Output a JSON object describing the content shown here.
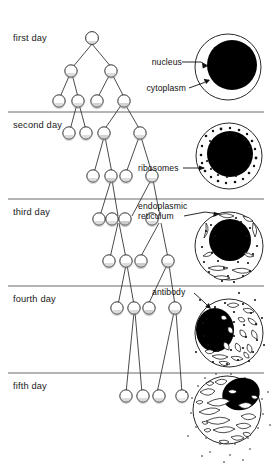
{
  "figure": {
    "type": "biology-diagram",
    "background_color": "#ffffff",
    "ink_color": "#111111",
    "divider_color": "#6b6b6b"
  },
  "rows": [
    {
      "id": "row-first-day",
      "day_label": "first day",
      "lineage_cell_count": 7,
      "terminal_cell_count": 4,
      "cell_diagram": {
        "name": "lymphocyte-day1",
        "features": [
          "nucleus",
          "cytoplasm"
        ],
        "nucleus_fill": "#000000",
        "cytoplasm_fill": "#ffffff",
        "organelle_count": 0,
        "ribosome_count": 0
      }
    },
    {
      "id": "row-second-day",
      "day_label": "second day",
      "lineage_cell_count": 8,
      "terminal_cell_count": 4,
      "cell_diagram": {
        "name": "lymphocyte-day2",
        "features": [
          "nucleus",
          "cytoplasm",
          "ribosomes"
        ],
        "nucleus_fill": "#000000",
        "cytoplasm_fill": "#ffffff",
        "organelle_count": 0,
        "ribosome_count": 34
      }
    },
    {
      "id": "row-third-day",
      "day_label": "third day",
      "lineage_cell_count": 8,
      "terminal_cell_count": 4,
      "cell_diagram": {
        "name": "lymphocyte-day3",
        "features": [
          "nucleus",
          "cytoplasm",
          "ribosomes",
          "endoplasmic reticulum"
        ],
        "nucleus_fill": "#000000",
        "cytoplasm_fill": "#ffffff",
        "organelle_count": 9,
        "ribosome_count": 22
      }
    },
    {
      "id": "row-fourth-day",
      "day_label": "fourth day",
      "lineage_cell_count": 4,
      "terminal_cell_count": 4,
      "cell_diagram": {
        "name": "plasma-cell-day4",
        "features": [
          "nucleus",
          "cytoplasm",
          "ribosomes",
          "endoplasmic reticulum",
          "antibody"
        ],
        "nucleus_fill": "#000000",
        "cytoplasm_fill": "#ffffff",
        "organelle_count": 16,
        "ribosome_count": 30
      }
    },
    {
      "id": "row-fifth-day",
      "day_label": "fifth day",
      "lineage_cell_count": 4,
      "terminal_cell_count": 4,
      "cell_diagram": {
        "name": "plasma-cell-day5",
        "features": [
          "nucleus",
          "cytoplasm",
          "endoplasmic reticulum",
          "antibody secretion"
        ],
        "nucleus_fill": "#000000",
        "cytoplasm_fill": "#ffffff",
        "organelle_count": 18,
        "ribosome_count": 0,
        "secreting": true
      }
    }
  ],
  "callouts": [
    {
      "id": "callout-nucleus",
      "text": "nucleus",
      "row": "row-first-day",
      "points_to": "nucleus"
    },
    {
      "id": "callout-cytoplasm",
      "text": "cytoplasm",
      "row": "row-first-day",
      "points_to": "cytoplasm"
    },
    {
      "id": "callout-ribosomes",
      "text": "ribosomes",
      "row": "row-second-day",
      "points_to": "ribosome"
    },
    {
      "id": "callout-er-line1",
      "text": "endoplasmic",
      "row": "row-third-day",
      "points_to": "endoplasmic-reticulum"
    },
    {
      "id": "callout-er-line2",
      "text": "reticulum",
      "row": "row-third-day",
      "points_to": "endoplasmic-reticulum"
    },
    {
      "id": "callout-antibody",
      "text": "antibody",
      "row": "row-fourth-day",
      "points_to": "antibody"
    }
  ]
}
